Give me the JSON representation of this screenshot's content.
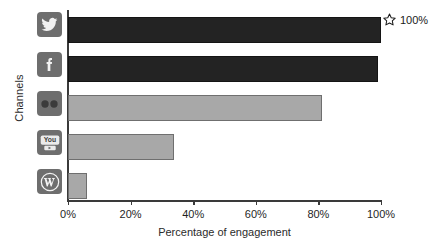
{
  "chart_data": {
    "type": "bar",
    "orientation": "horizontal",
    "title": "",
    "xlabel": "Percentage of engagement",
    "ylabel": "Channels",
    "categories": [
      "Twitter",
      "Facebook",
      "Flickr",
      "YouTube",
      "WordPress"
    ],
    "category_icons": [
      "twitter-icon",
      "facebook-icon",
      "flickr-icon",
      "youtube-icon",
      "wordpress-icon"
    ],
    "values": [
      100,
      99,
      81,
      34,
      6
    ],
    "xlim": [
      0,
      100
    ],
    "xticks": [
      0,
      20,
      40,
      60,
      80,
      100
    ],
    "xtick_labels": [
      "0%",
      "20%",
      "40%",
      "60%",
      "80%",
      "100%"
    ],
    "ytick_labels": [
      "",
      "",
      "",
      "",
      ""
    ],
    "grid": false,
    "legend": false,
    "bar_colors": [
      "#232323",
      "#232323",
      "#a8a8a8",
      "#a8a8a8",
      "#a8a8a8"
    ],
    "annotations": [
      {
        "icon": "star-icon",
        "text": "100%",
        "target_category": "Twitter",
        "value": 100
      }
    ]
  },
  "colors": {
    "bar_dark": "#232323",
    "bar_light": "#a8a8a8",
    "axis": "#3a3a3a",
    "icon_bg": "#6e6e6e",
    "background": "#ffffff",
    "text": "#1a1a1a"
  }
}
